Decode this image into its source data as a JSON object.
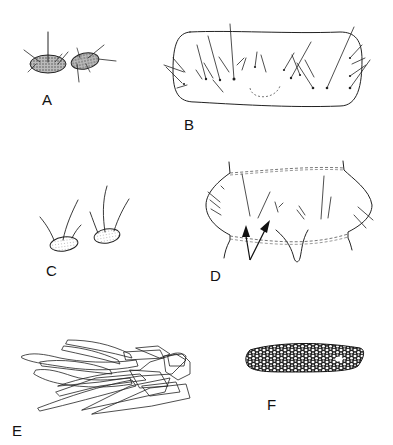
{
  "figure": {
    "panels": [
      {
        "id": "A",
        "label": "A",
        "description": "Two stippled sclerites bearing setae"
      },
      {
        "id": "B",
        "label": "B",
        "description": "Elongate segment outline with rows of setae and dotted medial arc"
      },
      {
        "id": "C",
        "label": "C",
        "description": "Two small stippled plates each with setae"
      },
      {
        "id": "D",
        "label": "D",
        "description": "Segment with dashed borders, setae, and two arrows pointing to setae"
      },
      {
        "id": "E",
        "label": "E",
        "description": "Cluster of elongate blade-like scales"
      },
      {
        "id": "F",
        "label": "F",
        "description": "Elongate reticulate (net-patterned) sclerite"
      }
    ]
  },
  "colors": {
    "ink": "#222222",
    "background": "#ffffff"
  }
}
